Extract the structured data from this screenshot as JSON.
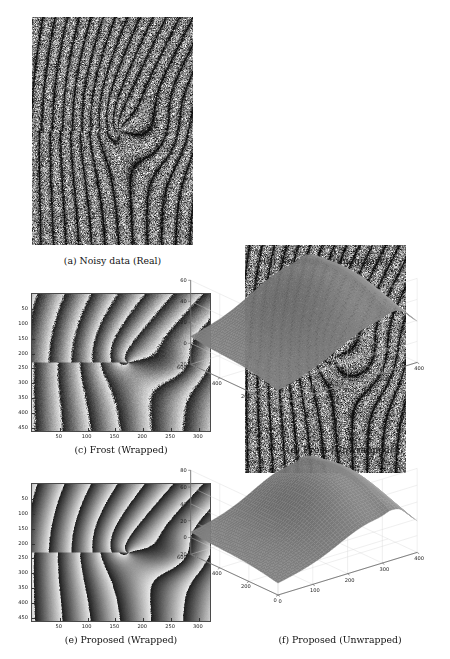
{
  "figure": {
    "panels": [
      {
        "id": "a",
        "caption": "(a) Noisy data (Real)",
        "type": "speckle-interferogram",
        "component": "real"
      },
      {
        "id": "b",
        "caption": "(b) Noisy data (Imaginary)",
        "type": "speckle-interferogram",
        "component": "imaginary"
      },
      {
        "id": "c",
        "caption": "(c) Frost (Wrapped)",
        "type": "wrapped-phase-map",
        "method": "Frost"
      },
      {
        "id": "d",
        "caption": "(d) Frost (Unwrapped)",
        "type": "surface-3d",
        "method": "Frost"
      },
      {
        "id": "e",
        "caption": "(e) Proposed (Wrapped)",
        "type": "wrapped-phase-map",
        "method": "Proposed"
      },
      {
        "id": "f",
        "caption": "(f) Proposed (Unwrapped)",
        "type": "surface-3d",
        "method": "Proposed"
      }
    ]
  },
  "chart_data": [
    {
      "panel": "c",
      "type": "heatmap",
      "title": "(c) Frost (Wrapped)",
      "xlabel": "",
      "ylabel": "",
      "xticks": [
        50,
        100,
        150,
        200,
        250,
        300
      ],
      "yticks": [
        50,
        100,
        150,
        200,
        250,
        300,
        350,
        400,
        450
      ],
      "xlim": [
        0,
        320
      ],
      "ylim": [
        0,
        460
      ],
      "colormap": "gray",
      "grid": false,
      "description": "Wrapped phase map with spiral vortex fringes, sawtooth 2-pi discontinuities, residual speckle noise"
    },
    {
      "panel": "d",
      "type": "surface",
      "title": "(d) Frost (Unwrapped)",
      "zticks": [
        -20,
        0,
        20,
        40,
        60
      ],
      "zlim": [
        -20,
        60
      ],
      "yticks": [
        0,
        200,
        400,
        600
      ],
      "ylim": [
        0,
        600
      ],
      "xticks": [
        0,
        100,
        200,
        300,
        400
      ],
      "xlim": [
        0,
        400
      ],
      "grid": true,
      "colormap": "gray",
      "description": "Unwrapped phase surface rising from about -5 at near corner to a ridge peaking near 55 with a step discontinuity at the right edge"
    },
    {
      "panel": "e",
      "type": "heatmap",
      "title": "(e) Proposed (Wrapped)",
      "xlabel": "",
      "ylabel": "",
      "xticks": [
        50,
        100,
        150,
        200,
        250,
        300
      ],
      "yticks": [
        50,
        100,
        150,
        200,
        250,
        300,
        350,
        400,
        450
      ],
      "xlim": [
        0,
        320
      ],
      "ylim": [
        0,
        460
      ],
      "colormap": "gray",
      "grid": false,
      "description": "Wrapped phase map with smoother, less noisy spiral fringes than Frost"
    },
    {
      "panel": "f",
      "type": "surface",
      "title": "(f) Proposed (Unwrapped)",
      "zticks": [
        -20,
        0,
        20,
        40,
        60,
        80
      ],
      "zlim": [
        -20,
        80
      ],
      "yticks": [
        0,
        200,
        400,
        600
      ],
      "ylim": [
        0,
        600
      ],
      "xticks": [
        0,
        100,
        200,
        300,
        400
      ],
      "xlim": [
        0,
        400
      ],
      "grid": true,
      "colormap": "gray",
      "description": "Unwrapped phase surface rising to a ridge peaking near 70 with sharper step feature at the right edge"
    }
  ]
}
